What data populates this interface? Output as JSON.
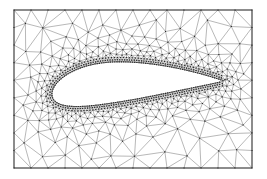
{
  "figure": {
    "kind": "unstructured-triangular-mesh-around-airfoil",
    "canvas": {
      "width": 267,
      "height": 179,
      "background": "#ffffff"
    },
    "frame": {
      "x": 14,
      "y": 10,
      "width": 238,
      "height": 158,
      "stroke": "#3d3d3d",
      "stroke_width": 1
    },
    "colors": {
      "mesh_line": "#4c4c4c",
      "node_dot": "#2a2a2a",
      "airfoil_outline": "#3a3a3a",
      "airfoil_fill": "#ffffff"
    },
    "airfoil": {
      "leading_edge": {
        "x": 52,
        "y": 95
      },
      "trailing_edge": {
        "x": 223,
        "y": 81
      },
      "thickness": 0.24,
      "camber": 0.045,
      "camber_pos": 0.4,
      "surface_spacing": 2.2,
      "outline_samples": 90
    },
    "mesh": {
      "seed": 20240613,
      "rings": [
        {
          "offset": 2.1,
          "spacing": 2.4
        },
        {
          "offset": 4.4,
          "spacing": 2.9
        }
      ],
      "poisson_min_dist_to_surface": 6,
      "near_spacing": 2.6,
      "growth": 0.42,
      "max_spacing": 20,
      "border_spacing": 17,
      "border_margin": 5,
      "candidates": 16000,
      "line_width": 0.4,
      "node_size": 1.1
    }
  }
}
